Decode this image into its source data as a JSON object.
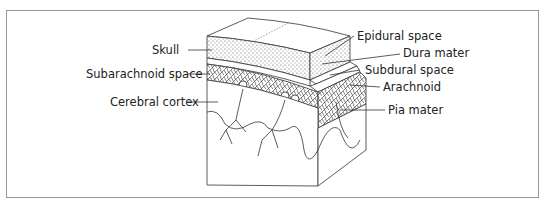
{
  "diagram": {
    "labels_left": [
      {
        "id": "skull",
        "text": "Skull"
      },
      {
        "id": "subarachnoid",
        "text": "Subarachnoid space"
      },
      {
        "id": "cortex",
        "text": "Cerebral cortex"
      }
    ],
    "labels_right": [
      {
        "id": "epidural",
        "text": "Epidural space"
      },
      {
        "id": "dura",
        "text": "Dura mater"
      },
      {
        "id": "subdural",
        "text": "Subdural space"
      },
      {
        "id": "arachnoid",
        "text": "Arachnoid"
      },
      {
        "id": "pia",
        "text": "Pia mater"
      }
    ]
  }
}
